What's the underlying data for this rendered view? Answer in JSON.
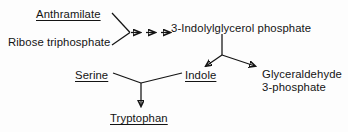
{
  "diagram": {
    "stroke_color": "#141414",
    "background_color": "#fdfdfd",
    "nodes": [
      {
        "id": "anthramilate",
        "label": "Anthramilate",
        "underlined": true,
        "x": 36,
        "y": 8
      },
      {
        "id": "ribose-triphosphate",
        "label": "Ribose triphosphate",
        "underlined": false,
        "x": 8,
        "y": 36
      },
      {
        "id": "indolylglycerol-phosphate",
        "label": "3-Indolylglycerol phosphate",
        "underlined": false,
        "x": 171,
        "y": 22
      },
      {
        "id": "serine",
        "label": "Serine",
        "underlined": true,
        "x": 75,
        "y": 69
      },
      {
        "id": "indole",
        "label": "Indole",
        "underlined": true,
        "x": 185,
        "y": 69
      },
      {
        "id": "glyceraldehyde-3-phosphate-line1",
        "label": "Glyceraldehyde",
        "underlined": false,
        "x": 262,
        "y": 68
      },
      {
        "id": "glyceraldehyde-3-phosphate-line2",
        "label": "3-phosphate",
        "underlined": false,
        "x": 262,
        "y": 81
      },
      {
        "id": "tryptophan",
        "label": "Tryptophan",
        "underlined": true,
        "x": 110,
        "y": 112
      }
    ],
    "edges": [
      {
        "id": "anthramilate-to-junction",
        "from": "anthramilate",
        "to": "junction-top",
        "arrowhead": false
      },
      {
        "id": "ribose-to-junction",
        "from": "ribose-triphosphate",
        "to": "junction-top",
        "arrowhead": false
      },
      {
        "id": "multistep-arrow-1",
        "from": "junction-top",
        "to": "indolylglycerol-phosphate",
        "arrowhead": true,
        "note": "first of three sequential step arrows"
      },
      {
        "id": "multistep-arrow-2",
        "from": "junction-top",
        "to": "indolylglycerol-phosphate",
        "arrowhead": true,
        "note": "second of three sequential step arrows"
      },
      {
        "id": "multistep-arrow-3",
        "from": "junction-top",
        "to": "indolylglycerol-phosphate",
        "arrowhead": true,
        "note": "third of three sequential step arrows"
      },
      {
        "id": "indolylglycerol-stem",
        "from": "indolylglycerol-phosphate",
        "to": "fork-vertex",
        "arrowhead": false
      },
      {
        "id": "fork-to-indole",
        "from": "fork-vertex",
        "to": "indole",
        "arrowhead": true
      },
      {
        "id": "fork-to-glyceraldehyde",
        "from": "fork-vertex",
        "to": "glyceraldehyde-3-phosphate-line1",
        "arrowhead": true
      },
      {
        "id": "serine-to-vertex",
        "from": "serine",
        "to": "lower-vertex",
        "arrowhead": false
      },
      {
        "id": "indole-to-vertex",
        "from": "indole",
        "to": "lower-vertex",
        "arrowhead": false
      },
      {
        "id": "vertex-to-tryptophan",
        "from": "lower-vertex",
        "to": "tryptophan",
        "arrowhead": true
      }
    ]
  }
}
